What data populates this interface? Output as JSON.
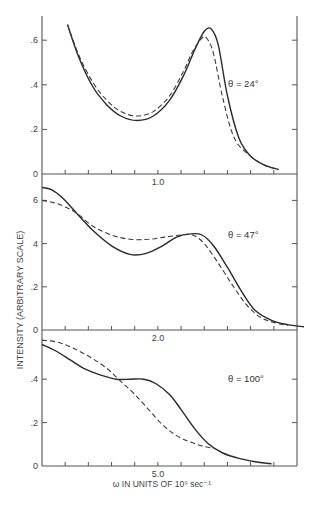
{
  "chart_data": [
    {
      "type": "line",
      "panel": "top",
      "annotation": "θ = 24°",
      "x_ticks": 11,
      "x_tick_label": {
        "index": 5,
        "text": "1.0"
      },
      "y_ticks": [
        {
          "v": 0,
          "text": "0"
        },
        {
          "v": 0.2,
          "text": ".2"
        },
        {
          "v": 0.4,
          "text": ".4"
        },
        {
          "v": 0.6,
          "text": ".6"
        }
      ],
      "ylim": [
        0,
        0.7
      ],
      "series": [
        {
          "name": "solid",
          "style": "solid",
          "x": [
            1.1,
            1.6,
            2.2,
            2.8,
            3.4,
            4.1,
            4.8,
            5.5,
            6.1,
            6.6,
            7.0,
            7.3,
            7.6,
            8.0,
            8.5,
            9.0,
            9.6,
            10.2
          ],
          "y": [
            0.67,
            0.52,
            0.39,
            0.31,
            0.26,
            0.24,
            0.26,
            0.33,
            0.44,
            0.56,
            0.64,
            0.65,
            0.58,
            0.35,
            0.16,
            0.08,
            0.04,
            0.02
          ]
        },
        {
          "name": "dashed",
          "style": "dashed",
          "x": [
            1.1,
            1.6,
            2.2,
            2.8,
            3.4,
            4.1,
            4.8,
            5.5,
            6.1,
            6.5,
            6.9,
            7.1,
            7.4,
            7.8,
            8.3,
            9.0,
            9.6,
            10.2
          ],
          "y": [
            0.67,
            0.53,
            0.41,
            0.33,
            0.28,
            0.26,
            0.28,
            0.35,
            0.46,
            0.55,
            0.61,
            0.61,
            0.54,
            0.34,
            0.16,
            0.08,
            0.04,
            0.02
          ]
        }
      ]
    },
    {
      "type": "line",
      "panel": "middle",
      "annotation": "θ = 47°",
      "x_ticks": 11,
      "x_tick_label": {
        "index": 5,
        "text": "2.0"
      },
      "y_ticks": [
        {
          "v": 0,
          "text": "0"
        },
        {
          "v": 0.2,
          "text": ".2"
        },
        {
          "v": 0.4,
          "text": "4"
        },
        {
          "v": 0.6,
          "text": "6"
        }
      ],
      "ylim": [
        0,
        0.7
      ],
      "series": [
        {
          "name": "solid",
          "style": "solid",
          "x": [
            0,
            0.4,
            0.9,
            1.5,
            2.2,
            3.0,
            3.8,
            4.5,
            5.2,
            5.8,
            6.4,
            6.9,
            7.4,
            8.0,
            8.6,
            9.2,
            9.9,
            10.6,
            11.3
          ],
          "y": [
            0.66,
            0.65,
            0.61,
            0.54,
            0.46,
            0.39,
            0.35,
            0.355,
            0.39,
            0.43,
            0.445,
            0.44,
            0.39,
            0.29,
            0.18,
            0.09,
            0.045,
            0.025,
            0.015
          ]
        },
        {
          "name": "dashed",
          "style": "dashed",
          "x": [
            0,
            0.5,
            1.0,
            1.5,
            2.2,
            3.0,
            3.8,
            4.6,
            5.3,
            6.0,
            6.5,
            7.0,
            7.6,
            8.2,
            8.8,
            9.4,
            10.0,
            10.6
          ],
          "y": [
            0.6,
            0.59,
            0.57,
            0.54,
            0.48,
            0.44,
            0.42,
            0.42,
            0.43,
            0.44,
            0.44,
            0.4,
            0.31,
            0.21,
            0.12,
            0.06,
            0.035,
            0.02
          ]
        }
      ]
    },
    {
      "type": "line",
      "panel": "bottom",
      "annotation": "θ = 100°",
      "x_ticks": 11,
      "x_tick_label": {
        "index": 5,
        "text": "5.0"
      },
      "y_ticks": [
        {
          "v": 0,
          "text": "0"
        },
        {
          "v": 0.2,
          "text": ".2"
        },
        {
          "v": 0.4,
          "text": ".4"
        }
      ],
      "ylim": [
        0,
        0.58
      ],
      "series": [
        {
          "name": "solid",
          "style": "solid",
          "x": [
            0,
            0.6,
            1.2,
            1.8,
            2.5,
            3.2,
            3.8,
            4.4,
            4.9,
            5.5,
            6.0,
            6.6,
            7.2,
            7.8,
            8.5,
            9.2,
            9.9
          ],
          "y": [
            0.56,
            0.53,
            0.49,
            0.45,
            0.42,
            0.4,
            0.4,
            0.4,
            0.38,
            0.33,
            0.26,
            0.17,
            0.1,
            0.06,
            0.035,
            0.02,
            0.01
          ]
        },
        {
          "name": "dashed",
          "style": "dashed",
          "x": [
            0,
            0.7,
            1.4,
            2.1,
            2.8,
            3.4,
            4.0,
            4.6,
            5.2,
            5.8,
            6.4,
            7.0,
            7.5
          ],
          "y": [
            0.58,
            0.57,
            0.54,
            0.5,
            0.45,
            0.39,
            0.33,
            0.26,
            0.19,
            0.14,
            0.11,
            0.09,
            0.08
          ]
        }
      ]
    }
  ],
  "labels": {
    "y_axis_title": "INTENSITY (ARBITRARY SCALE)",
    "x_axis_title": "ω IN UNITS OF 10⁹ sec⁻¹",
    "panel_annotations": [
      "θ = 24°",
      "θ = 47°",
      "θ = 100°"
    ],
    "x_tick_labels": [
      "1.0",
      "2.0",
      "5.0"
    ]
  }
}
